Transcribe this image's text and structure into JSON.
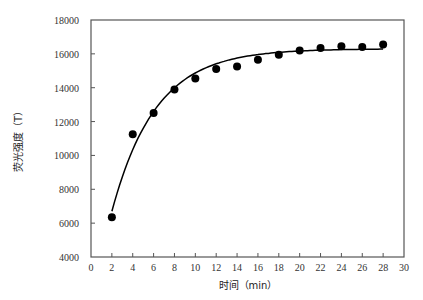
{
  "chart_data": {
    "type": "scatter",
    "title": "",
    "xlabel": "时间（min）",
    "ylabel": "荧光强度（T）",
    "xlim": [
      0,
      30
    ],
    "ylim": [
      4000,
      18000
    ],
    "xticks": [
      0,
      2,
      4,
      6,
      8,
      10,
      12,
      14,
      16,
      18,
      20,
      22,
      24,
      26,
      28,
      30
    ],
    "yticks": [
      4000,
      6000,
      8000,
      10000,
      12000,
      14000,
      16000,
      18000
    ],
    "grid": false,
    "legend": null,
    "series": [
      {
        "name": "measured",
        "kind": "scatter",
        "marker": "filled-circle",
        "color": "#000000",
        "x": [
          2,
          4,
          6,
          8,
          10,
          12,
          14,
          16,
          18,
          20,
          22,
          24,
          26,
          28
        ],
        "y": [
          6350,
          11250,
          12500,
          13900,
          14550,
          15100,
          15250,
          15650,
          15950,
          16200,
          16350,
          16450,
          16400,
          16550
        ]
      },
      {
        "name": "fit",
        "kind": "line",
        "color": "#000000",
        "model": "y = A - B*exp(-k*(x-2))",
        "params": {
          "A": 16300,
          "B": 9600,
          "k": 0.238
        },
        "x_range": [
          2,
          28
        ]
      }
    ]
  }
}
